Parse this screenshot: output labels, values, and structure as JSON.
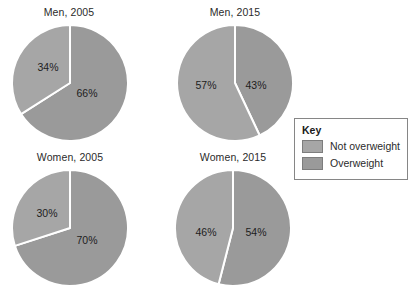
{
  "legend": {
    "title": "Key",
    "entries": [
      {
        "label": "Not overweight",
        "color": "#a6a6a6",
        "swatch_name": "legend-swatch-not-overweight"
      },
      {
        "label": "Overweight",
        "color": "#9a9a9a",
        "swatch_name": "legend-swatch-overweight"
      }
    ]
  },
  "colors": {
    "not_overweight": "#a6a6a6",
    "overweight": "#9a9a9a",
    "divider": "#ffffff",
    "background": "#ffffff",
    "text": "#231f20",
    "legend_border": "#868686"
  },
  "charts": [
    {
      "id": "men-2005",
      "title": "Men, 2005",
      "labels": [
        "34%",
        "30%"
      ],
      "not_overweight_label": "34%",
      "overweight_label": "66%"
    },
    {
      "id": "men-2015",
      "title": "Men, 2015",
      "not_overweight_label": "57%",
      "overweight_label": "43%"
    },
    {
      "id": "women-2005",
      "title": "Women, 2005",
      "not_overweight_label": "30%",
      "overweight_label": "70%"
    },
    {
      "id": "women-2015",
      "title": "Women, 2015",
      "not_overweight_label": "46%",
      "overweight_label": "54%"
    }
  ],
  "chart_data": [
    {
      "type": "pie",
      "title": "Men, 2005",
      "categories": [
        "Overweight",
        "Not overweight"
      ],
      "values": [
        66,
        34
      ],
      "data_labels": [
        "66%",
        "34%"
      ],
      "units": "percent",
      "colors": [
        "#9a9a9a",
        "#a6a6a6"
      ],
      "start_angle_deg": 0,
      "direction": "clockwise",
      "legend_position": "right"
    },
    {
      "type": "pie",
      "title": "Men, 2015",
      "categories": [
        "Overweight",
        "Not overweight"
      ],
      "values": [
        43,
        57
      ],
      "data_labels": [
        "43%",
        "57%"
      ],
      "units": "percent",
      "colors": [
        "#9a9a9a",
        "#a6a6a6"
      ],
      "start_angle_deg": 0,
      "direction": "clockwise",
      "legend_position": "right"
    },
    {
      "type": "pie",
      "title": "Women, 2005",
      "categories": [
        "Overweight",
        "Not overweight"
      ],
      "values": [
        70,
        30
      ],
      "data_labels": [
        "70%",
        "30%"
      ],
      "units": "percent",
      "colors": [
        "#9a9a9a",
        "#a6a6a6"
      ],
      "start_angle_deg": 0,
      "direction": "clockwise",
      "legend_position": "right"
    },
    {
      "type": "pie",
      "title": "Women, 2015",
      "categories": [
        "Overweight",
        "Not overweight"
      ],
      "values": [
        54,
        46
      ],
      "data_labels": [
        "54%",
        "46%"
      ],
      "units": "percent",
      "colors": [
        "#9a9a9a",
        "#a6a6a6"
      ],
      "start_angle_deg": 0,
      "direction": "clockwise",
      "legend_position": "right"
    }
  ]
}
